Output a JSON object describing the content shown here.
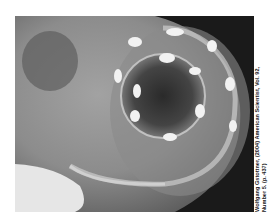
{
  "image": {
    "subject": "x-ray of heart with spiral fiber structure and bright nodes",
    "caption_line1": "Wolfgang Gstottner, (2004) American Scientist, Vol. 92,",
    "caption_line2": "Number 5. (p. 437)"
  }
}
